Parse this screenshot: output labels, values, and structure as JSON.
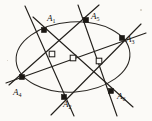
{
  "figure": {
    "name": "pascal-theorem-hexagon-in-conic",
    "background_color": "#fbfaf7",
    "ink_color": "#1b1814",
    "width": 152,
    "height": 121,
    "conic": {
      "type": "ellipse",
      "cx": 73,
      "cy": 57,
      "rx": 57,
      "ry": 35,
      "rotation_deg": -4
    },
    "vertices": [
      {
        "id": "A1",
        "label": "A",
        "subscript": "1",
        "x": 44,
        "y": 30,
        "label_x": 47,
        "label_y": 14,
        "marker": "filled-square"
      },
      {
        "id": "A2",
        "label": "A",
        "subscript": "2",
        "x": 64,
        "y": 97,
        "label_x": 63,
        "label_y": 100,
        "marker": "filled-square"
      },
      {
        "id": "A3",
        "label": "A",
        "subscript": "3",
        "x": 122,
        "y": 38,
        "label_x": 126,
        "label_y": 35,
        "marker": "filled-square"
      },
      {
        "id": "A4",
        "label": "A",
        "subscript": "4",
        "x": 22,
        "y": 77,
        "label_x": 13,
        "label_y": 88,
        "marker": "filled-square"
      },
      {
        "id": "A5",
        "label": "A",
        "subscript": "5",
        "x": 86,
        "y": 20,
        "label_x": 91,
        "label_y": 12,
        "marker": "filled-square"
      },
      {
        "id": "A6",
        "label": "A",
        "subscript": "6",
        "x": 111,
        "y": 91,
        "label_x": 117,
        "label_y": 92,
        "marker": "filled-square"
      }
    ],
    "pascal_points": [
      {
        "id": "P1",
        "x": 52,
        "y": 54,
        "marker": "hollow-square"
      },
      {
        "id": "P2",
        "x": 73,
        "y": 58,
        "marker": "hollow-square"
      },
      {
        "id": "P3",
        "x": 99,
        "y": 61,
        "marker": "hollow-square"
      }
    ],
    "hexagon_sides": [
      {
        "id": "side-A1-A2",
        "from": "A1",
        "to": "A2",
        "x1": 25,
        "y1": 6,
        "x2": 74,
        "y2": 116
      },
      {
        "id": "side-A2-A3",
        "from": "A2",
        "to": "A3",
        "x1": 51,
        "y1": 115,
        "x2": 141,
        "y2": 24
      },
      {
        "id": "side-A3-A4",
        "from": "A3",
        "to": "A4",
        "x1": 146,
        "y1": 33,
        "x2": 6,
        "y2": 83
      },
      {
        "id": "side-A4-A5",
        "from": "A4",
        "to": "A5",
        "x1": 9,
        "y1": 85,
        "x2": 99,
        "y2": 5
      },
      {
        "id": "side-A5-A6",
        "from": "A5",
        "to": "A6",
        "x1": 78,
        "y1": 5,
        "x2": 117,
        "y2": 116
      },
      {
        "id": "side-A6-A1",
        "from": "A6",
        "to": "A1",
        "x1": 133,
        "y1": 107,
        "x2": 33,
        "y2": 17
      }
    ],
    "pascal_line": {
      "id": "pascal-line",
      "x1": 44,
      "y1": 52,
      "x2": 108,
      "y2": 63
    }
  }
}
